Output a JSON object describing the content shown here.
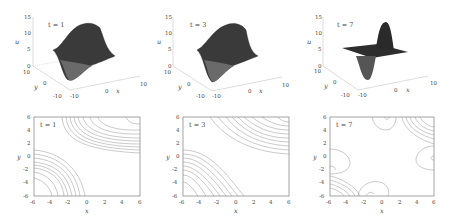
{
  "figure": {
    "surface_plots": [
      {
        "time_label": "t = 1",
        "z_label": "u",
        "x_label": "x",
        "y_label": "y",
        "z_ticks": [
          "0",
          "5",
          "10",
          "15"
        ],
        "x_ticks": [
          "-10",
          "0",
          "10"
        ],
        "y_ticks": [
          "-10",
          "0",
          "10"
        ]
      },
      {
        "time_label": "t = 3",
        "z_label": "u",
        "x_label": "x",
        "y_label": "y",
        "z_ticks": [
          "0",
          "5",
          "10",
          "15"
        ],
        "x_ticks": [
          "-10",
          "0",
          "10"
        ],
        "y_ticks": [
          "-10",
          "0",
          "10"
        ]
      },
      {
        "time_label": "t = 7",
        "z_label": "u",
        "x_label": "x",
        "y_label": "y",
        "z_ticks": [
          "0",
          "5",
          "10",
          "15"
        ],
        "x_ticks": [
          "-10",
          "0",
          "10"
        ],
        "y_ticks": [
          "-10",
          "0",
          "10"
        ]
      }
    ],
    "contour_plots": [
      {
        "time_label": "t = 1",
        "x_label": "x",
        "y_label": "y",
        "x_ticks": [
          "-6",
          "-4",
          "-2",
          "0",
          "2",
          "4",
          "6"
        ],
        "y_ticks": [
          "-6",
          "-4",
          "-2",
          "0",
          "2",
          "4",
          "6"
        ]
      },
      {
        "time_label": "t = 3",
        "x_label": "x",
        "y_label": "y",
        "x_ticks": [
          "-6",
          "-4",
          "-2",
          "0",
          "2",
          "4",
          "6"
        ],
        "y_ticks": [
          "-6",
          "-4",
          "-2",
          "0",
          "2",
          "4",
          "6"
        ]
      },
      {
        "time_label": "t = 7",
        "x_label": "x",
        "y_label": "y",
        "x_ticks": [
          "-6",
          "-4",
          "-2",
          "0",
          "2",
          "4",
          "6"
        ],
        "y_ticks": [
          "-6",
          "-4",
          "-2",
          "0",
          "2",
          "4",
          "6"
        ]
      }
    ]
  },
  "colors": {
    "surface_dark": "#2a2a2a",
    "surface_light": "#8a8a8a",
    "contour_line": "#777777",
    "axis": "#555555"
  }
}
